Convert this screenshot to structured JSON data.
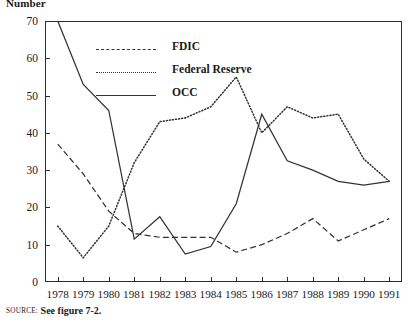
{
  "figure": {
    "y_axis_title": "Number",
    "source_label": "SOURCE:",
    "source_text": "See figure 7-2."
  },
  "legend": {
    "position": "inside-top-left",
    "entries": [
      {
        "label": "FDIC",
        "style": "dashed",
        "color": "#333333"
      },
      {
        "label": "Federal Reserve",
        "style": "dotted",
        "color": "#333333"
      },
      {
        "label": "OCC",
        "style": "solid",
        "color": "#333333"
      }
    ]
  },
  "chart_data": {
    "type": "line",
    "title": "",
    "subtitle": "",
    "xlabel": "",
    "ylabel": "Number",
    "xlim": [
      1978,
      1991
    ],
    "ylim": [
      0,
      70
    ],
    "ytick_interval": 10,
    "yticks": [
      0,
      10,
      20,
      30,
      40,
      50,
      60,
      70
    ],
    "grid": false,
    "legend_position": "inside-top-left",
    "x": [
      1978,
      1979,
      1980,
      1981,
      1982,
      1983,
      1984,
      1985,
      1986,
      1987,
      1988,
      1989,
      1990,
      1991
    ],
    "categories": [
      "1978",
      "1979",
      "1980",
      "1981",
      "1982",
      "1983",
      "1984",
      "1985",
      "1986",
      "1987",
      "1988",
      "1989",
      "1990",
      "1991"
    ],
    "series": [
      {
        "name": "FDIC",
        "style": "dashed",
        "color": "#333333",
        "values": [
          37,
          29,
          19,
          13,
          12,
          12,
          12,
          8,
          10,
          13,
          17,
          11,
          14,
          17
        ]
      },
      {
        "name": "Federal Reserve",
        "style": "dotted",
        "color": "#333333",
        "values": [
          15,
          6.5,
          15,
          32,
          43,
          44,
          47,
          55,
          40,
          47,
          44,
          45,
          33,
          27
        ]
      },
      {
        "name": "OCC",
        "style": "solid",
        "color": "#333333",
        "values": [
          70,
          53,
          46,
          11.5,
          17.5,
          7.5,
          9.5,
          21,
          45,
          32.5,
          30,
          27,
          26,
          27
        ]
      }
    ]
  },
  "axes": {
    "y_tick_labels": [
      "70",
      "60",
      "50",
      "40",
      "30",
      "20",
      "10",
      "0"
    ],
    "x_tick_labels": [
      "1978",
      "1979",
      "1980",
      "1981",
      "1982",
      "1983",
      "1984",
      "1985",
      "1986",
      "1987",
      "1988",
      "1989",
      "1990",
      "1991"
    ]
  }
}
